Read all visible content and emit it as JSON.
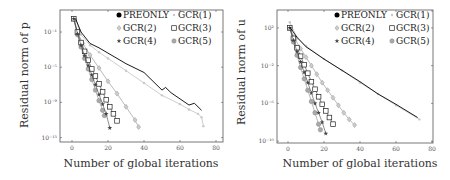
{
  "figure": {
    "xlabel": "Number of global iterations"
  },
  "legend": [
    {
      "name": "PREONLY",
      "marker": "filled-circle",
      "color": "#000000"
    },
    {
      "name": "GCR(1)",
      "marker": "small-circle",
      "color": "#c8c8c8"
    },
    {
      "name": "GCR(2)",
      "marker": "diamond",
      "color": "#a8a8a8"
    },
    {
      "name": "GCR(3)",
      "marker": "square",
      "color": "#333333"
    },
    {
      "name": "GCR(4)",
      "marker": "star",
      "color": "#444444"
    },
    {
      "name": "GCR(5)",
      "marker": "circle",
      "color": "#999999"
    }
  ],
  "chart_data": [
    {
      "type": "line",
      "title": "",
      "xlabel": "Number of global iterations",
      "ylabel": "Residual norm of p",
      "yscale": "log",
      "xlim": [
        -5,
        80
      ],
      "ylim_exp": [
        -13.5,
        1.5
      ],
      "xticks": [
        0,
        20,
        40,
        60,
        80
      ],
      "yticks_exp": [
        -1,
        -5,
        -9,
        -13
      ],
      "ytick_labels": [
        "10⁻¹",
        "10⁻⁵",
        "10⁻⁹",
        "10⁻¹³"
      ],
      "grid": false,
      "legend_position": "upper right",
      "series": [
        {
          "name": "PREONLY",
          "x": [
            2,
            5,
            10,
            15,
            20,
            30,
            40,
            50,
            52,
            55,
            60,
            65,
            68,
            72
          ],
          "log10y": [
            0.5,
            -1.0,
            -2.3,
            -2.8,
            -3.4,
            -4.6,
            -5.6,
            -7.6,
            -7.3,
            -7.9,
            -8.6,
            -9.3,
            -9.1,
            -9.9
          ]
        },
        {
          "name": "GCR(1)",
          "x": [
            2,
            5,
            10,
            15,
            20,
            30,
            40,
            50,
            60,
            65,
            70,
            72,
            73
          ],
          "log10y": [
            0.5,
            -1.3,
            -2.5,
            -3.3,
            -4.0,
            -5.4,
            -6.8,
            -8.2,
            -9.2,
            -9.8,
            -10.3,
            -10.7,
            -11.7
          ]
        },
        {
          "name": "GCR(2)",
          "x": [
            1,
            3,
            6,
            10,
            15,
            20,
            25,
            30,
            35,
            37
          ],
          "log10y": [
            0.5,
            -1.0,
            -2.3,
            -3.6,
            -5.1,
            -6.6,
            -8.0,
            -9.5,
            -11.0,
            -11.8
          ]
        },
        {
          "name": "GCR(3)",
          "x": [
            1,
            3,
            5,
            7,
            9,
            11,
            13,
            15,
            17,
            19,
            21,
            23,
            25
          ],
          "log10y": [
            0.5,
            -1.0,
            -2.2,
            -3.2,
            -4.2,
            -5.2,
            -6.0,
            -6.9,
            -7.8,
            -8.7,
            -9.5,
            -10.3,
            -11.1
          ]
        },
        {
          "name": "GCR(4)",
          "x": [
            1,
            3,
            5,
            7,
            9,
            11,
            13,
            15,
            17,
            19,
            21
          ],
          "log10y": [
            0.5,
            -1.2,
            -2.5,
            -3.7,
            -4.8,
            -5.9,
            -7.0,
            -8.1,
            -9.2,
            -10.3,
            -11.9
          ]
        },
        {
          "name": "GCR(5)",
          "x": [
            1,
            3,
            5,
            7,
            9,
            11,
            13,
            15,
            17,
            18
          ],
          "log10y": [
            0.5,
            -1.3,
            -2.7,
            -4.0,
            -5.2,
            -6.4,
            -7.6,
            -8.8,
            -9.9,
            -10.5
          ]
        }
      ]
    },
    {
      "type": "line",
      "title": "",
      "xlabel": "Number of global iterations",
      "ylabel": "Residual norm of u",
      "yscale": "log",
      "xlim": [
        -5,
        80
      ],
      "ylim_exp": [
        -10.2,
        3.9
      ],
      "xticks": [
        0,
        20,
        40,
        60,
        80
      ],
      "yticks_exp": [
        2,
        -2,
        -6,
        -10
      ],
      "ytick_labels": [
        "10²",
        "10⁻²",
        "10⁻⁶",
        "10⁻¹⁰"
      ],
      "grid": false,
      "legend_position": "upper right",
      "series": [
        {
          "name": "PREONLY",
          "x": [
            1,
            5,
            10,
            20,
            30,
            40,
            50,
            60,
            72
          ],
          "log10y": [
            2.1,
            1.0,
            0.0,
            -1.3,
            -2.5,
            -3.7,
            -5.0,
            -6.1,
            -7.5
          ]
        },
        {
          "name": "GCR(1)",
          "x": [
            1,
            5,
            10,
            20,
            30,
            40,
            50,
            60,
            73
          ],
          "log10y": [
            2.6,
            1.0,
            0.1,
            -1.3,
            -2.5,
            -3.8,
            -5.0,
            -6.2,
            -7.7
          ]
        },
        {
          "name": "GCR(2)",
          "x": [
            1,
            4,
            7,
            10,
            13,
            16,
            19,
            22,
            25,
            28,
            31,
            34,
            37
          ],
          "log10y": [
            2.0,
            0.8,
            -0.2,
            -1.1,
            -2.0,
            -2.9,
            -3.8,
            -4.6,
            -5.4,
            -6.2,
            -7.0,
            -7.7,
            -8.3
          ]
        },
        {
          "name": "GCR(3)",
          "x": [
            1,
            3,
            5,
            7,
            9,
            11,
            13,
            15,
            17,
            19,
            21,
            23,
            25
          ],
          "log10y": [
            2.0,
            0.9,
            -0.1,
            -1.0,
            -1.9,
            -2.8,
            -3.7,
            -4.5,
            -5.3,
            -6.1,
            -6.8,
            -7.5,
            -8.2
          ]
        },
        {
          "name": "GCR(4)",
          "x": [
            1,
            3,
            5,
            7,
            9,
            11,
            13,
            15,
            17,
            19,
            21
          ],
          "log10y": [
            2.0,
            0.7,
            -0.5,
            -1.6,
            -2.7,
            -3.8,
            -4.9,
            -6.0,
            -7.0,
            -8.0,
            -9.2
          ]
        },
        {
          "name": "GCR(5)",
          "x": [
            1,
            3,
            5,
            7,
            9,
            11,
            13,
            15,
            17,
            18
          ],
          "log10y": [
            2.0,
            0.5,
            -0.9,
            -2.2,
            -3.4,
            -4.6,
            -5.8,
            -7.0,
            -8.2,
            -8.8
          ]
        }
      ]
    }
  ]
}
